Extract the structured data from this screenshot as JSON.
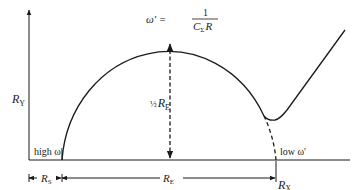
{
  "diagram": {
    "type": "nyquist-impedance-plot",
    "axes": {
      "y_label": "R",
      "y_label_sub": "Y",
      "x_label": "R",
      "x_label_sub": "X"
    },
    "peak_label": {
      "prefix": "ω' =",
      "numerator": "1",
      "denominator_c": "C",
      "denominator_c_sub": "Σ",
      "denominator_r": "R"
    },
    "radius_label": {
      "fraction": "½",
      "symbol": "R",
      "sub": "E"
    },
    "high_freq_label": "high ω'",
    "low_freq_label": "low ω'",
    "dimensions": {
      "rs_label": "R",
      "rs_sub": "S",
      "re_label": "R",
      "re_sub": "E"
    },
    "colors": {
      "stroke": "#1a1a1a",
      "background": "#ffffff"
    }
  }
}
